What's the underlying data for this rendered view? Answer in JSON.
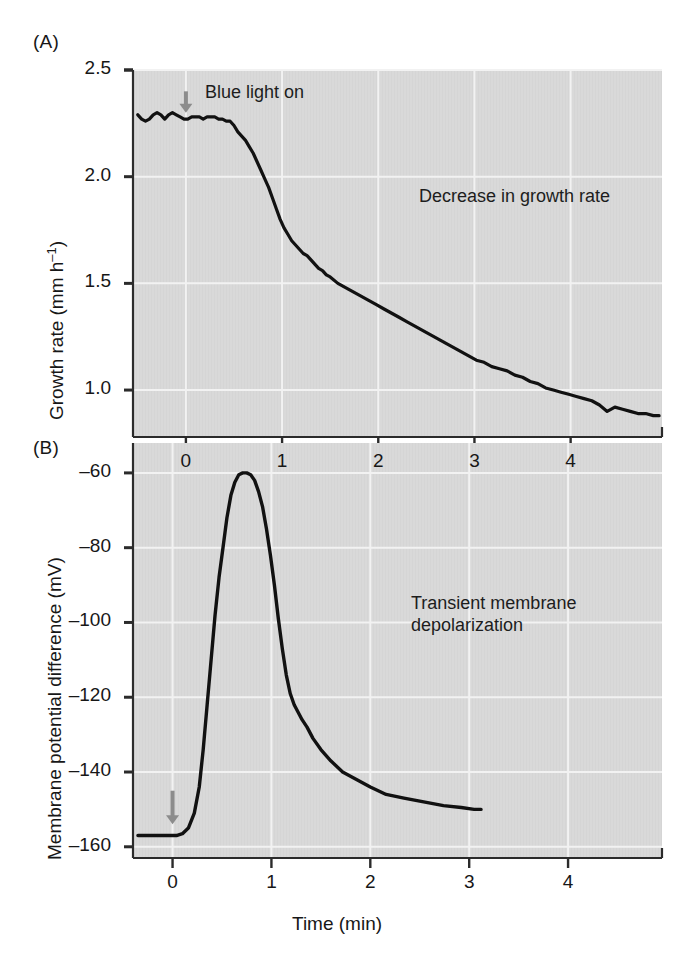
{
  "figure": {
    "background": "#ffffff",
    "plot_background": "#d9d9d9",
    "grid_color": "#f2f2f2",
    "axis_color": "#2b2b2b",
    "trace_color": "#111111",
    "arrow_color": "#8c8c8c",
    "width": 692,
    "height": 964
  },
  "panels": {
    "a": {
      "label": "(A)",
      "annotation": "Decrease in growth rate",
      "arrow_label": "Blue light on",
      "arrow_at_time": 0
    },
    "b": {
      "label": "(B)",
      "annotation": "Transient membrane\ndepolarization",
      "arrow_at_time": 0
    }
  },
  "chart_data": [
    {
      "type": "line",
      "panel": "A",
      "title": "Decrease in growth rate",
      "xlabel": "",
      "ylabel": "Growth rate (mm h−1)",
      "ylabel_plain": "Growth rate (mm h-1)",
      "ylabel_parts": {
        "text": "Growth rate (mm h",
        "sup": "–1",
        "tail": ")"
      },
      "xlim": [
        -0.55,
        4.95
      ],
      "ylim": [
        0.78,
        2.5
      ],
      "xticks": [
        0,
        1,
        2,
        3,
        4
      ],
      "xticklabels": [
        "0",
        "1",
        "2",
        "3",
        "4"
      ],
      "yticks": [
        1.0,
        1.5,
        2.0,
        2.5
      ],
      "yticklabels": [
        "1.0",
        "1.5",
        "2.0",
        "2.5"
      ],
      "grid": true,
      "legend": "none",
      "annotations": [
        {
          "text": "Blue light on",
          "x": 0.12,
          "y": 2.42
        },
        {
          "text": "Decrease in growth rate",
          "x": 2.1,
          "y": 1.83
        }
      ],
      "arrows": [
        {
          "x": 0.0,
          "y_from": 2.4,
          "y_to": 2.3,
          "color": "#8c8c8c"
        }
      ],
      "series": [
        {
          "name": "Growth rate",
          "x": [
            -0.5,
            -0.46,
            -0.42,
            -0.38,
            -0.34,
            -0.3,
            -0.26,
            -0.22,
            -0.18,
            -0.14,
            -0.1,
            -0.06,
            -0.02,
            0.02,
            0.06,
            0.1,
            0.14,
            0.18,
            0.22,
            0.26,
            0.3,
            0.34,
            0.38,
            0.42,
            0.46,
            0.5,
            0.54,
            0.58,
            0.62,
            0.66,
            0.7,
            0.74,
            0.78,
            0.82,
            0.86,
            0.9,
            0.94,
            0.98,
            1.02,
            1.06,
            1.1,
            1.14,
            1.18,
            1.22,
            1.26,
            1.3,
            1.34,
            1.38,
            1.42,
            1.46,
            1.5,
            1.58,
            1.66,
            1.74,
            1.82,
            1.9,
            1.98,
            2.06,
            2.14,
            2.22,
            2.3,
            2.38,
            2.46,
            2.54,
            2.62,
            2.7,
            2.78,
            2.86,
            2.94,
            3.02,
            3.1,
            3.18,
            3.26,
            3.34,
            3.42,
            3.5,
            3.58,
            3.66,
            3.74,
            3.82,
            3.9,
            3.98,
            4.06,
            4.14,
            4.22,
            4.3,
            4.38,
            4.46,
            4.54,
            4.62,
            4.7,
            4.78,
            4.86,
            4.92
          ],
          "y": [
            2.29,
            2.27,
            2.26,
            2.27,
            2.29,
            2.3,
            2.29,
            2.27,
            2.29,
            2.3,
            2.29,
            2.28,
            2.27,
            2.27,
            2.28,
            2.28,
            2.28,
            2.27,
            2.28,
            2.28,
            2.28,
            2.27,
            2.27,
            2.26,
            2.26,
            2.24,
            2.21,
            2.19,
            2.17,
            2.14,
            2.11,
            2.07,
            2.03,
            1.99,
            1.95,
            1.9,
            1.85,
            1.8,
            1.76,
            1.73,
            1.7,
            1.68,
            1.66,
            1.64,
            1.63,
            1.61,
            1.59,
            1.57,
            1.56,
            1.54,
            1.53,
            1.5,
            1.48,
            1.46,
            1.44,
            1.42,
            1.4,
            1.38,
            1.36,
            1.34,
            1.32,
            1.3,
            1.28,
            1.26,
            1.24,
            1.22,
            1.2,
            1.18,
            1.16,
            1.14,
            1.13,
            1.11,
            1.1,
            1.09,
            1.07,
            1.06,
            1.04,
            1.03,
            1.01,
            1.0,
            0.99,
            0.98,
            0.97,
            0.96,
            0.95,
            0.93,
            0.9,
            0.92,
            0.91,
            0.9,
            0.89,
            0.89,
            0.88,
            0.88
          ]
        }
      ]
    },
    {
      "type": "line",
      "panel": "B",
      "title": "Transient membrane depolarization",
      "xlabel": "Time (min)",
      "ylabel": "Membrane potential difference (mV)",
      "xlim": [
        -0.4,
        4.95
      ],
      "ylim": [
        -163,
        -52
      ],
      "xticks": [
        0,
        1,
        2,
        3,
        4
      ],
      "xticklabels": [
        "0",
        "1",
        "2",
        "3",
        "4"
      ],
      "yticks": [
        -160,
        -140,
        -120,
        -100,
        -80,
        -60
      ],
      "yticklabels": [
        "–160",
        "–140",
        "–120",
        "–100",
        "–80",
        "–60"
      ],
      "grid": true,
      "legend": "none",
      "annotations": [
        {
          "text": "Transient membrane",
          "x": 2.0,
          "y": -88
        },
        {
          "text": "depolarization",
          "x": 2.0,
          "y": -95
        }
      ],
      "arrows": [
        {
          "x": 0.0,
          "y_from": -145,
          "y_to": -154,
          "color": "#8c8c8c"
        }
      ],
      "series": [
        {
          "name": "Membrane potential difference",
          "x": [
            -0.35,
            -0.28,
            -0.2,
            -0.12,
            -0.04,
            0.04,
            0.1,
            0.16,
            0.22,
            0.27,
            0.31,
            0.35,
            0.39,
            0.43,
            0.47,
            0.51,
            0.55,
            0.59,
            0.63,
            0.67,
            0.71,
            0.75,
            0.79,
            0.83,
            0.87,
            0.91,
            0.95,
            0.99,
            1.03,
            1.07,
            1.11,
            1.15,
            1.19,
            1.23,
            1.27,
            1.31,
            1.36,
            1.42,
            1.5,
            1.6,
            1.72,
            1.86,
            2.0,
            2.16,
            2.34,
            2.54,
            2.74,
            2.92,
            3.05,
            3.12
          ],
          "y": [
            -157,
            -157,
            -157,
            -157,
            -157,
            -157,
            -156.5,
            -155,
            -151,
            -144,
            -134,
            -122,
            -110,
            -98,
            -88,
            -80,
            -72,
            -66,
            -62.5,
            -60.5,
            -60,
            -60,
            -60.5,
            -62,
            -65,
            -69,
            -75,
            -82,
            -90,
            -99,
            -107,
            -114,
            -119,
            -122,
            -124,
            -126,
            -128,
            -131,
            -134,
            -137,
            -140,
            -142,
            -144,
            -146,
            -147,
            -148,
            -149,
            -149.5,
            -150,
            -150
          ]
        }
      ]
    }
  ]
}
